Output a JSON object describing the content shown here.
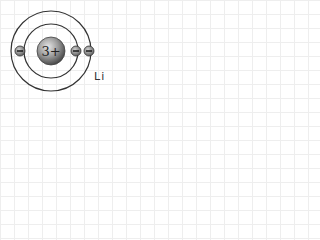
{
  "diagram": {
    "type": "bohr-model-atom",
    "element_symbol": "Li",
    "nucleus": {
      "charge_label": "3+",
      "cx": 51,
      "cy": 51,
      "r": 14
    },
    "shells": [
      {
        "name": "inner",
        "r": 27,
        "electrons": 2
      },
      {
        "name": "outer",
        "r": 40,
        "electrons": 1
      }
    ],
    "electron_symbol": "−",
    "colors": {
      "orbit": "#333333",
      "nucleus_light": "#d8d8d8",
      "nucleus_dark": "#555555",
      "electron_fill": "#888888",
      "text": "#222222"
    }
  }
}
